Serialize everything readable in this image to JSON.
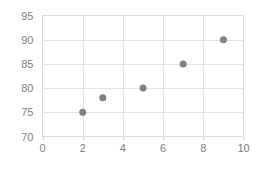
{
  "chart_data": {
    "type": "scatter",
    "title": "",
    "subtitle": "",
    "xlabel": "",
    "ylabel": "",
    "xlim": [
      0,
      10
    ],
    "ylim": [
      70,
      95
    ],
    "xticks": [
      0,
      2,
      4,
      6,
      8,
      10
    ],
    "yticks": [
      70,
      75,
      80,
      85,
      90,
      95
    ],
    "xtick_labels": [
      "0",
      "2",
      "4",
      "6",
      "8",
      "10"
    ],
    "ytick_labels": [
      "70",
      "75",
      "80",
      "85",
      "90",
      "95"
    ],
    "grid": true,
    "grid_color": "#e2e2e2",
    "legend": false,
    "legend_position": "none",
    "background_color": "#ffffff",
    "marker_color": "#808080",
    "marker_shape": "circle",
    "marker_size": 7,
    "label_color": "#808080",
    "series": [
      {
        "name": "",
        "x": [
          2,
          3,
          5,
          7,
          9
        ],
        "y": [
          75,
          78,
          80,
          85,
          90
        ],
        "points": [
          {
            "x": 2,
            "y": 75
          },
          {
            "x": 3,
            "y": 78
          },
          {
            "x": 5,
            "y": 80
          },
          {
            "x": 7,
            "y": 85
          },
          {
            "x": 9,
            "y": 90
          }
        ]
      }
    ]
  }
}
